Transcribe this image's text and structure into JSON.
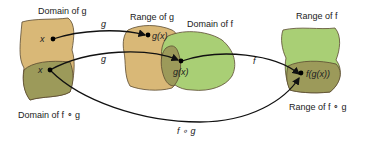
{
  "diagram": {
    "colors": {
      "domain_g": "#d9b877",
      "range_g": "#d9b877",
      "domain_f": "#a9cf75",
      "range_f": "#a9cf75",
      "overlap": "#9c9a5a",
      "outline": "#5a4a30",
      "arrow": "#111111"
    },
    "labels": {
      "domain_g": "Domain of g",
      "range_g": "Range of g",
      "domain_f": "Domain of f",
      "range_f": "Range of f",
      "domain_fog": "Domain of f ∘ g",
      "range_fog": "Range of f ∘ g"
    },
    "points": {
      "x_top": "x",
      "x_bottom": "x",
      "gx_top": "g(x)",
      "gx_bottom": "g(x)",
      "fgx": "f(g(x))"
    },
    "arrows": {
      "g_top": "g",
      "g_bottom": "g",
      "f": "f",
      "fog": "f ∘ g"
    }
  }
}
